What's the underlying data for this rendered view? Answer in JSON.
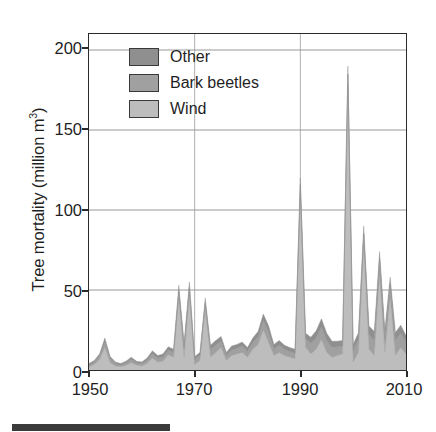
{
  "figure": {
    "background_color": "#ffffff",
    "frame_color": "#2a2a2a",
    "caption_rule_color": "#3b3b3b"
  },
  "axes": {
    "y_title": "Tree mortality (million m",
    "y_title_sup": "3",
    "y_title_close": ")",
    "y_ticks": [
      "0",
      "50",
      "100",
      "150",
      "200"
    ],
    "x_ticks": [
      "1950",
      "1970",
      "1990",
      "2010"
    ]
  },
  "legend": {
    "items": [
      {
        "label": "Other",
        "color": "#8f8f8f"
      },
      {
        "label": "Bark beetles",
        "color": "#a0a0a0"
      },
      {
        "label": "Wind",
        "color": "#bdbdbd"
      }
    ]
  },
  "chart_data": {
    "type": "area",
    "stacked": true,
    "title": "",
    "xlabel": "",
    "ylabel": "Tree mortality (million m3)",
    "xlim": [
      1950,
      2010
    ],
    "ylim": [
      0,
      210
    ],
    "y_ticks": [
      0,
      50,
      100,
      150,
      200
    ],
    "x_ticks": [
      1950,
      1970,
      1990,
      2010
    ],
    "grid": "horizontal",
    "legend_position": "top-left-inside",
    "colors": {
      "Wind": "#bdbdbd",
      "Bark beetles": "#a0a0a0",
      "Other": "#8f8f8f"
    },
    "x": [
      1950,
      1951,
      1952,
      1953,
      1954,
      1955,
      1956,
      1957,
      1958,
      1959,
      1960,
      1961,
      1962,
      1963,
      1964,
      1965,
      1966,
      1967,
      1968,
      1969,
      1970,
      1971,
      1972,
      1973,
      1974,
      1975,
      1976,
      1977,
      1978,
      1979,
      1980,
      1981,
      1982,
      1983,
      1984,
      1985,
      1986,
      1987,
      1988,
      1989,
      1990,
      1991,
      1992,
      1993,
      1994,
      1995,
      1996,
      1997,
      1998,
      1999,
      2000,
      2001,
      2002,
      2003,
      2004,
      2005,
      2006,
      2007,
      2008,
      2009,
      2010
    ],
    "series": [
      {
        "name": "Wind",
        "values": [
          2.0,
          3.5,
          6.5,
          14.0,
          4.5,
          2.5,
          2.0,
          3.0,
          4.5,
          3.0,
          2.5,
          4.0,
          7.5,
          5.0,
          5.5,
          9.5,
          8.0,
          45.0,
          8.0,
          47.0,
          3.5,
          6.0,
          38.0,
          8.0,
          11.0,
          14.0,
          6.0,
          9.0,
          10.0,
          11.0,
          8.0,
          13.0,
          16.0,
          25.0,
          17.0,
          9.0,
          11.0,
          9.0,
          8.0,
          7.0,
          110.0,
          14.0,
          10.0,
          13.0,
          19.0,
          11.0,
          8.0,
          9.0,
          10.0,
          178.0,
          5.0,
          11.0,
          78.0,
          13.0,
          9.0,
          60.0,
          11.0,
          45.0,
          9.0,
          14.0,
          10.0
        ]
      },
      {
        "name": "Bark beetles",
        "values": [
          1.0,
          1.5,
          2.0,
          3.5,
          2.5,
          1.5,
          1.0,
          1.5,
          2.0,
          1.5,
          1.5,
          2.0,
          2.5,
          2.5,
          2.5,
          3.0,
          3.0,
          4.0,
          5.5,
          4.5,
          3.0,
          3.0,
          3.5,
          4.5,
          4.5,
          4.0,
          3.0,
          3.5,
          3.5,
          4.0,
          3.5,
          4.0,
          4.5,
          6.0,
          6.5,
          4.0,
          4.5,
          4.0,
          3.5,
          3.5,
          6.0,
          5.5,
          6.5,
          7.0,
          8.0,
          7.5,
          6.0,
          5.5,
          5.0,
          7.0,
          7.0,
          8.0,
          7.0,
          9.0,
          9.5,
          9.0,
          9.0,
          8.5,
          9.5,
          9.0,
          7.5
        ]
      },
      {
        "name": "Other",
        "values": [
          1.0,
          1.0,
          1.5,
          2.5,
          1.5,
          1.0,
          1.0,
          1.0,
          1.5,
          1.0,
          1.0,
          1.5,
          2.0,
          1.5,
          2.0,
          2.0,
          2.0,
          4.0,
          3.5,
          3.5,
          2.0,
          2.0,
          3.5,
          3.0,
          3.0,
          3.0,
          2.0,
          2.5,
          2.5,
          2.5,
          2.5,
          3.0,
          3.5,
          4.0,
          4.0,
          3.0,
          3.0,
          2.5,
          2.5,
          2.5,
          4.0,
          3.5,
          4.0,
          4.5,
          5.0,
          4.5,
          4.0,
          3.5,
          3.5,
          5.0,
          4.0,
          4.5,
          5.0,
          5.5,
          5.5,
          5.0,
          5.0,
          4.5,
          5.0,
          5.0,
          4.0
        ]
      }
    ],
    "annotations": [
      {
        "x": 1967,
        "label": "peak",
        "total": 53
      },
      {
        "x": 1969,
        "label": "peak",
        "total": 55
      },
      {
        "x": 1972,
        "label": "peak",
        "total": 45
      },
      {
        "x": 1990,
        "label": "peak",
        "total": 120
      },
      {
        "x": 1999,
        "label": "peak",
        "total": 190
      },
      {
        "x": 2002,
        "label": "peak",
        "total": 90
      },
      {
        "x": 2005,
        "label": "peak",
        "total": 74
      },
      {
        "x": 2007,
        "label": "peak",
        "total": 58
      }
    ]
  }
}
